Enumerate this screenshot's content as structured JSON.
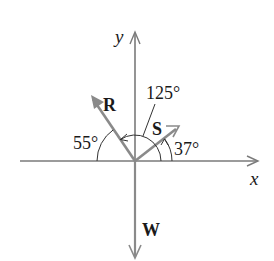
{
  "diagram": {
    "type": "force-vector-diagram",
    "origin": {
      "x": 135,
      "y": 161
    },
    "axes": {
      "x_label": "x",
      "y_label": "y"
    },
    "vectors": [
      {
        "name": "R",
        "label": "R",
        "direction_deg": 125,
        "description": "points up-left"
      },
      {
        "name": "S",
        "label": "S",
        "direction_deg": 37,
        "description": "points up-right"
      },
      {
        "name": "W",
        "label": "W",
        "direction_deg": 270,
        "description": "points straight down"
      }
    ],
    "angles": [
      {
        "label": "55°",
        "between": "negative x-axis and R"
      },
      {
        "label": "125°",
        "between": "positive x-axis and R"
      },
      {
        "label": "37°",
        "between": "positive x-axis and S"
      }
    ],
    "colors": {
      "axis": "#7a7a7a",
      "vector": "#8a8a8a",
      "arc": "#333333",
      "text": "#1a1a1a"
    }
  }
}
